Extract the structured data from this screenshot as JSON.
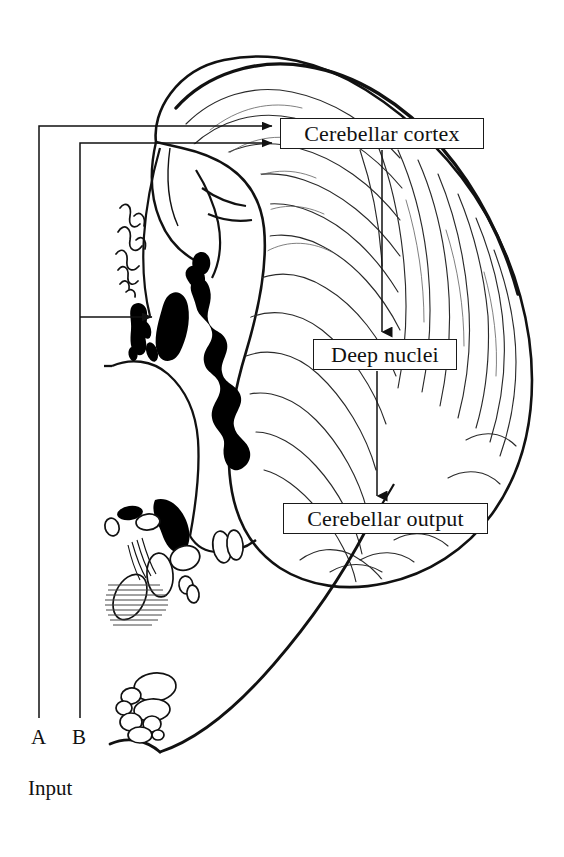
{
  "figure": {
    "type": "anatomical-flow-diagram",
    "background_color": "#ffffff",
    "line_color": "#111111",
    "nuclei_fill": "#000000"
  },
  "boxes": {
    "cortex": {
      "label": "Cerebellar cortex"
    },
    "deep": {
      "label": "Deep nuclei"
    },
    "output": {
      "label": "Cerebellar output"
    }
  },
  "inputs": {
    "a_label": "A",
    "b_label": "B",
    "caption": "Input"
  },
  "flow": {
    "edges": [
      {
        "from": "A",
        "to": "Cerebellar cortex"
      },
      {
        "from": "B",
        "to": "Cerebellar cortex"
      },
      {
        "from": "B",
        "to": "Deep nuclei"
      },
      {
        "from": "Cerebellar cortex",
        "to": "Deep nuclei"
      },
      {
        "from": "Deep nuclei",
        "to": "Cerebellar output"
      }
    ]
  }
}
